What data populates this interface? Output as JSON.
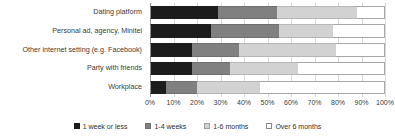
{
  "chart_data": {
    "type": "bar",
    "orientation": "horizontal",
    "stacked": true,
    "stack_unit": "percent",
    "title": "",
    "subtitle": "",
    "xlabel": "",
    "ylabel": "",
    "xlim": [
      0,
      100
    ],
    "grid": true,
    "legend_position": "bottom",
    "categories": [
      "Dating platform",
      "Personal ad, agency, Minitel",
      "Other internet setting (e.g. Facebook)",
      "Party with friends",
      "Workplace"
    ],
    "xticks": [
      0,
      10,
      20,
      30,
      40,
      50,
      60,
      70,
      80,
      90,
      100
    ],
    "xticklabels": [
      "0%",
      "10%",
      "20%",
      "30%",
      "40%",
      "50%",
      "60%",
      "70%",
      "80%",
      "90%",
      "100%"
    ],
    "series": [
      {
        "name": "1 week or less",
        "color": "#1c1c1c",
        "values": [
          29,
          26,
          18,
          18,
          7
        ]
      },
      {
        "name": "1-4 weeks",
        "color": "#808080",
        "values": [
          25,
          29,
          20,
          16,
          13
        ]
      },
      {
        "name": "1-6 months",
        "color": "#d2d2d2",
        "values": [
          34,
          23,
          41,
          29,
          27
        ]
      },
      {
        "name": "Over 6 months",
        "color": "#ffffff",
        "values": [
          12,
          22,
          21,
          37,
          53
        ]
      }
    ]
  }
}
